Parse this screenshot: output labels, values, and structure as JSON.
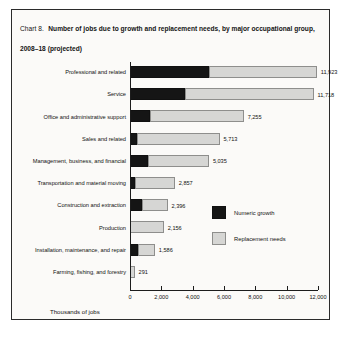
{
  "card": {
    "title_prefix": "Chart 8.",
    "title_main": "Number of jobs due to growth and replacement needs, by major occupational group, 2008–18 (projected)"
  },
  "legend": {
    "growth_label": "Numeric growth",
    "replacement_label": "Replacement needs",
    "growth_color": "#151515",
    "replacement_color": "#d6d6d4"
  },
  "chart_data": {
    "type": "bar",
    "orientation": "horizontal",
    "stacked": true,
    "title": "Number of jobs due to growth and replacement needs, by major occupational group, 2008–18 (projected)",
    "xlabel": "Thousands of jobs",
    "ylabel": "",
    "xlim": [
      0,
      12000
    ],
    "xticks": [
      0,
      2000,
      4000,
      6000,
      8000,
      10000,
      12000
    ],
    "xtick_labels": [
      "0",
      "2,000",
      "4,000",
      "6,000",
      "8,000",
      "10,000",
      "12,000"
    ],
    "grid": false,
    "legend_position": "inside-right",
    "categories": [
      "Professional and related",
      "Service",
      "Office and administrative support",
      "Sales and related",
      "Management, business, and financial",
      "Transportation and material moving",
      "Construction and extraction",
      "Production",
      "Installation, maintenance, and repair",
      "Farming, fishing, and forestry"
    ],
    "series": [
      {
        "name": "Numeric growth",
        "color": "#151515",
        "values": [
          5050,
          3540,
          1280,
          460,
          1160,
          350,
          760,
          20,
          520,
          20
        ]
      },
      {
        "name": "Replacement needs",
        "color": "#d6d6d4",
        "values": [
          6873,
          8178,
          5975,
          5253,
          3875,
          2507,
          1636,
          2136,
          1066,
          271
        ]
      }
    ],
    "totals": [
      11923,
      11718,
      7255,
      5713,
      5035,
      2857,
      2396,
      2156,
      1586,
      291
    ],
    "total_labels": [
      "11,923",
      "11,718",
      "7,255",
      "5,713",
      "5,035",
      "2,857",
      "2,396",
      "2,156",
      "1,586",
      "291"
    ]
  }
}
